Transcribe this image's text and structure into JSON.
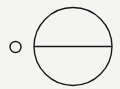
{
  "diagram": {
    "background": "#f4f4f2",
    "stroke": "#1a1a1a",
    "small_circle": {
      "cx": 15.5,
      "cy": 47,
      "r": 5.5
    },
    "large_circle": {
      "cx": 73,
      "cy": 46.5,
      "r": 39
    },
    "diameter": {
      "x1": 34,
      "y1": 46.5,
      "x2": 112,
      "y2": 46.5
    }
  }
}
